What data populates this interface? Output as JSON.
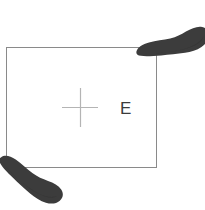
{
  "figure": {
    "title": "",
    "background_color": "#ffffff",
    "boundary": {
      "name": "plot-boundary-rectangle",
      "shape": "rectangle",
      "stroke_color": "#8a8a8a",
      "stroke_width": 1,
      "fill": "none",
      "x": 6,
      "y": 47,
      "width": 151,
      "height": 121
    },
    "center_mark": {
      "name": "center-cross-mark",
      "symbol": "plus",
      "stroke_color": "#b0b0b0",
      "stroke_width": 1,
      "center_x": 80,
      "center_y": 107,
      "arm_half_length_x": 18,
      "arm_half_length_y": 19
    },
    "labels": [
      {
        "name": "point-label-e",
        "text": "E",
        "x": 121,
        "y": 113,
        "color": "#3b3b3b",
        "font_size": 17
      }
    ],
    "footprints": [
      {
        "name": "footprint-top-right",
        "description": "shoe sole print overlapping top-right corner",
        "fill_color": "#3c3c3c",
        "rotation_deg": -8,
        "center_x": 172,
        "center_y": 45
      },
      {
        "name": "footprint-bottom-left",
        "description": "shoe sole print overlapping bottom-left corner",
        "fill_color": "#3c3c3c",
        "rotation_deg": 42,
        "center_x": 30,
        "center_y": 180
      }
    ]
  },
  "colors": {
    "line": "#8a8a8a",
    "cross": "#b0b0b0",
    "text": "#3b3b3b",
    "footprint": "#3c3c3c",
    "background": "#ffffff"
  }
}
